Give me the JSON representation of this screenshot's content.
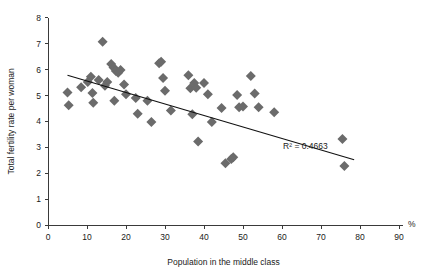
{
  "chart_data": {
    "type": "scatter",
    "title": "",
    "xlabel": "Population in the middle class",
    "ylabel": "Total fertility rate per woman",
    "x_unit": "%",
    "xlim": [
      0,
      90
    ],
    "ylim": [
      0,
      8
    ],
    "xticks": [
      0,
      10,
      20,
      30,
      40,
      50,
      60,
      70,
      80,
      90
    ],
    "yticks": [
      0,
      1,
      2,
      3,
      4,
      5,
      6,
      7,
      8
    ],
    "grid": false,
    "legend": null,
    "annotations": [
      {
        "text": "R² = 0.4663",
        "x": 66,
        "y": 2.95
      }
    ],
    "marker": {
      "shape": "diamond",
      "color": "#6b6b6b",
      "size": 5
    },
    "trendline": {
      "type": "linear",
      "color": "#111111",
      "x_start": 5.0,
      "y_start": 5.78,
      "x_end": 78.5,
      "y_end": 2.52,
      "r_squared": 0.4663
    },
    "points": [
      {
        "x": 5.0,
        "y": 5.12
      },
      {
        "x": 5.3,
        "y": 4.62
      },
      {
        "x": 8.5,
        "y": 5.32
      },
      {
        "x": 10.2,
        "y": 5.52
      },
      {
        "x": 11.0,
        "y": 5.72
      },
      {
        "x": 11.4,
        "y": 5.1
      },
      {
        "x": 11.6,
        "y": 4.72
      },
      {
        "x": 13.0,
        "y": 5.6
      },
      {
        "x": 14.0,
        "y": 7.08
      },
      {
        "x": 14.6,
        "y": 5.38
      },
      {
        "x": 15.2,
        "y": 5.52
      },
      {
        "x": 16.2,
        "y": 6.22
      },
      {
        "x": 16.8,
        "y": 6.08
      },
      {
        "x": 17.4,
        "y": 5.95
      },
      {
        "x": 18.0,
        "y": 5.88
      },
      {
        "x": 18.6,
        "y": 5.98
      },
      {
        "x": 17.0,
        "y": 4.8
      },
      {
        "x": 19.5,
        "y": 5.42
      },
      {
        "x": 20.0,
        "y": 5.05
      },
      {
        "x": 22.5,
        "y": 4.9
      },
      {
        "x": 23.0,
        "y": 4.3
      },
      {
        "x": 25.5,
        "y": 4.8
      },
      {
        "x": 26.5,
        "y": 3.98
      },
      {
        "x": 28.5,
        "y": 6.25
      },
      {
        "x": 29.0,
        "y": 6.3
      },
      {
        "x": 29.5,
        "y": 5.68
      },
      {
        "x": 30.0,
        "y": 5.18
      },
      {
        "x": 31.5,
        "y": 4.42
      },
      {
        "x": 36.0,
        "y": 5.78
      },
      {
        "x": 36.5,
        "y": 5.28
      },
      {
        "x": 38.0,
        "y": 5.3
      },
      {
        "x": 37.5,
        "y": 5.48
      },
      {
        "x": 37.0,
        "y": 4.28
      },
      {
        "x": 38.5,
        "y": 3.22
      },
      {
        "x": 40.0,
        "y": 5.48
      },
      {
        "x": 41.0,
        "y": 5.05
      },
      {
        "x": 42.0,
        "y": 3.98
      },
      {
        "x": 44.5,
        "y": 4.52
      },
      {
        "x": 45.5,
        "y": 2.38
      },
      {
        "x": 47.0,
        "y": 2.55
      },
      {
        "x": 47.5,
        "y": 2.62
      },
      {
        "x": 48.5,
        "y": 5.02
      },
      {
        "x": 49.0,
        "y": 4.55
      },
      {
        "x": 50.0,
        "y": 4.58
      },
      {
        "x": 52.0,
        "y": 5.75
      },
      {
        "x": 53.0,
        "y": 5.08
      },
      {
        "x": 54.0,
        "y": 4.55
      },
      {
        "x": 58.0,
        "y": 4.35
      },
      {
        "x": 75.5,
        "y": 3.32
      },
      {
        "x": 76.0,
        "y": 2.28
      }
    ]
  }
}
